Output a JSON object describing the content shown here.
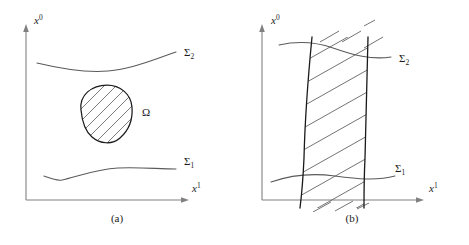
{
  "figure": {
    "panels": [
      {
        "id": "a",
        "caption": "(a)",
        "axis_vertical_label_base": "x",
        "axis_vertical_label_sup": "0",
        "axis_horizontal_label_base": "x",
        "axis_horizontal_label_sup": "1",
        "curve_upper_label_base": "Σ",
        "curve_upper_label_sub": "2",
        "curve_lower_label_base": "Σ",
        "curve_lower_label_sub": "1",
        "region_label": "Ω"
      },
      {
        "id": "b",
        "caption": "(b)",
        "axis_vertical_label_base": "x",
        "axis_vertical_label_sup": "0",
        "axis_horizontal_label_base": "x",
        "axis_horizontal_label_sup": "1",
        "curve_upper_label_base": "Σ",
        "curve_upper_label_sub": "2",
        "curve_lower_label_base": "Σ",
        "curve_lower_label_sub": "1"
      }
    ],
    "colors": {
      "axis": "#808080",
      "curve": "#555555",
      "outline": "#1a1a1a",
      "hatch": "#555555",
      "background": "#ffffff",
      "text": "#1a1a1a"
    }
  }
}
